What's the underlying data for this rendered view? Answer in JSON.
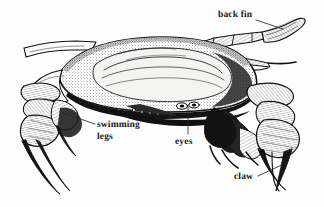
{
  "figure": {
    "background_color": "#fdfdfd",
    "ink_color": "#161616",
    "width": 324,
    "height": 207
  },
  "labels": [
    {
      "id": "back-fin",
      "text": "back fin",
      "lines": [
        "back fin"
      ],
      "x": 218,
      "y": 10,
      "leader": {
        "x1": 256,
        "y1": 20,
        "x2": 283,
        "y2": 29
      }
    },
    {
      "id": "swimming-legs",
      "text": "swimming legs",
      "lines": [
        "swimming",
        "legs"
      ],
      "x": 97,
      "y": 120,
      "leader": {
        "x1": 95,
        "y1": 124,
        "x2": 60,
        "y2": 112
      }
    },
    {
      "id": "eyes",
      "text": "eyes",
      "lines": [
        "eyes"
      ],
      "x": 175,
      "y": 137,
      "leader": {
        "x1": 188,
        "y1": 134,
        "x2": 188,
        "y2": 105
      }
    },
    {
      "id": "claw",
      "text": "claw",
      "lines": [
        "claw"
      ],
      "x": 234,
      "y": 172,
      "leader": {
        "x1": 258,
        "y1": 176,
        "x2": 286,
        "y2": 163
      }
    }
  ],
  "anatomy_parts": [
    "carapace",
    "back fin",
    "swimming legs",
    "eyes",
    "left claw",
    "right claw",
    "walking legs"
  ]
}
